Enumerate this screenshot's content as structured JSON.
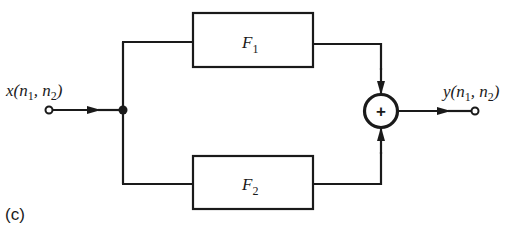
{
  "figure": {
    "panel_label": "(c)"
  },
  "input": {
    "label_main": "x",
    "label_args_open": "(",
    "n1": "n",
    "n1_sub": "1",
    "sep": ", ",
    "n2": "n",
    "n2_sub": "2",
    "label_args_close": ")"
  },
  "output": {
    "label_main": "y",
    "label_args_open": "(",
    "n1": "n",
    "n1_sub": "1",
    "sep": ", ",
    "n2": "n",
    "n2_sub": "2",
    "label_args_close": ")"
  },
  "blocks": [
    {
      "id": "F1",
      "name": "F",
      "sub": "1"
    },
    {
      "id": "F2",
      "name": "F",
      "sub": "2"
    }
  ],
  "summer": {
    "symbol": "+"
  },
  "colors": {
    "line": "#1a1a1a",
    "background": "#ffffff"
  }
}
